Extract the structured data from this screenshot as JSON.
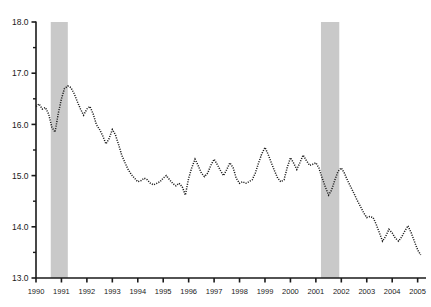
{
  "chart_data": {
    "type": "line",
    "title": "",
    "subtitle": "",
    "xlabel": "",
    "ylabel": "",
    "xlim": [
      1990.0,
      2005.25
    ],
    "ylim": [
      13.0,
      18.0
    ],
    "grid": false,
    "legend": null,
    "line_style": "dotted",
    "line_color": "#1a1a1a",
    "axis_color": "#1a1a1a",
    "background_color": "#ffffff",
    "shaded_band_color": "#c9c9c9",
    "y_ticks_major": [
      "13.0",
      "14.0",
      "15.0",
      "16.0",
      "17.0",
      "18.0"
    ],
    "y_ticks_minor": [
      13.5,
      14.5,
      15.5,
      16.5,
      17.5
    ],
    "x_tick_labels": [
      "1990",
      "1991",
      "1992",
      "1993",
      "1994",
      "1995",
      "1996",
      "1997",
      "1998",
      "1999",
      "2000",
      "2001",
      "2002",
      "2003",
      "2004",
      "2005"
    ],
    "x_tick_values": [
      1990,
      1991,
      1992,
      1993,
      1994,
      1995,
      1996,
      1997,
      1998,
      1999,
      2000,
      2001,
      2002,
      2003,
      2004,
      2005
    ],
    "shaded_bands": [
      {
        "name": "recession-1990-1991",
        "start": 1990.58,
        "end": 1991.25
      },
      {
        "name": "recession-2001",
        "start": 2001.2,
        "end": 2001.92
      }
    ],
    "series": [
      {
        "name": "series-1",
        "x": [
          1990.0,
          1990.12,
          1990.25,
          1990.37,
          1990.5,
          1990.62,
          1990.75,
          1990.87,
          1991.0,
          1991.12,
          1991.25,
          1991.37,
          1991.5,
          1991.62,
          1991.75,
          1991.87,
          1992.0,
          1992.12,
          1992.25,
          1992.37,
          1992.5,
          1992.62,
          1992.75,
          1992.87,
          1993.0,
          1993.12,
          1993.25,
          1993.37,
          1993.5,
          1993.62,
          1993.75,
          1993.87,
          1994.0,
          1994.12,
          1994.25,
          1994.37,
          1994.5,
          1994.62,
          1994.75,
          1994.87,
          1995.0,
          1995.12,
          1995.25,
          1995.37,
          1995.5,
          1995.62,
          1995.75,
          1995.87,
          1996.0,
          1996.12,
          1996.25,
          1996.37,
          1996.5,
          1996.62,
          1996.75,
          1996.87,
          1997.0,
          1997.12,
          1997.25,
          1997.37,
          1997.5,
          1997.62,
          1997.75,
          1997.87,
          1998.0,
          1998.12,
          1998.25,
          1998.37,
          1998.5,
          1998.62,
          1998.75,
          1998.87,
          1999.0,
          1999.12,
          1999.25,
          1999.37,
          1999.5,
          1999.62,
          1999.75,
          1999.87,
          2000.0,
          2000.12,
          2000.25,
          2000.37,
          2000.5,
          2000.62,
          2000.75,
          2000.87,
          2001.0,
          2001.12,
          2001.25,
          2001.37,
          2001.5,
          2001.62,
          2001.75,
          2001.87,
          2002.0,
          2002.12,
          2002.25,
          2002.37,
          2002.5,
          2002.62,
          2002.75,
          2002.87,
          2003.0,
          2003.12,
          2003.25,
          2003.37,
          2003.5,
          2003.62,
          2003.75,
          2003.87,
          2004.0,
          2004.12,
          2004.25,
          2004.37,
          2004.5,
          2004.62,
          2004.75,
          2004.87,
          2005.0,
          2005.12
        ],
        "values": [
          16.35,
          16.4,
          16.3,
          16.33,
          16.2,
          15.95,
          15.85,
          16.2,
          16.5,
          16.7,
          16.75,
          16.72,
          16.6,
          16.45,
          16.3,
          16.18,
          16.3,
          16.35,
          16.2,
          16.0,
          15.9,
          15.78,
          15.62,
          15.72,
          15.9,
          15.8,
          15.6,
          15.4,
          15.25,
          15.12,
          15.02,
          14.95,
          14.88,
          14.9,
          14.95,
          14.92,
          14.85,
          14.82,
          14.85,
          14.88,
          14.95,
          15.0,
          14.92,
          14.85,
          14.8,
          14.85,
          14.78,
          14.62,
          14.95,
          15.15,
          15.32,
          15.2,
          15.05,
          14.98,
          15.05,
          15.2,
          15.32,
          15.22,
          15.1,
          15.0,
          15.12,
          15.25,
          15.15,
          14.95,
          14.85,
          14.88,
          14.85,
          14.88,
          14.92,
          15.05,
          15.25,
          15.42,
          15.55,
          15.42,
          15.25,
          15.1,
          14.95,
          14.88,
          14.92,
          15.15,
          15.35,
          15.25,
          15.12,
          15.25,
          15.4,
          15.3,
          15.2,
          15.22,
          15.25,
          15.15,
          14.95,
          14.78,
          14.62,
          14.72,
          14.92,
          15.08,
          15.15,
          15.05,
          14.9,
          14.78,
          14.65,
          14.52,
          14.4,
          14.28,
          14.18,
          14.2,
          14.18,
          14.05,
          13.88,
          13.72,
          13.82,
          13.95,
          13.88,
          13.78,
          13.72,
          13.8,
          13.92,
          14.02,
          13.88,
          13.72,
          13.55,
          13.45
        ]
      }
    ]
  }
}
